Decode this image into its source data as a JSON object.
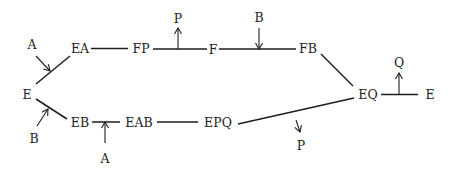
{
  "diagram": {
    "type": "enzyme-mechanism",
    "colors": {
      "ink": "#1e1e1e",
      "background": "#ffffff"
    },
    "nodes": [
      {
        "id": "E_left",
        "label": "E"
      },
      {
        "id": "EA",
        "label": "EA"
      },
      {
        "id": "FP",
        "label": "FP"
      },
      {
        "id": "F",
        "label": "F"
      },
      {
        "id": "FB",
        "label": "FB"
      },
      {
        "id": "EQ",
        "label": "EQ"
      },
      {
        "id": "E_right",
        "label": "E"
      },
      {
        "id": "EB",
        "label": "EB"
      },
      {
        "id": "EAB",
        "label": "EAB"
      },
      {
        "id": "EPQ",
        "label": "EPQ"
      }
    ],
    "edges": [
      {
        "from": "E_left",
        "to": "EA"
      },
      {
        "from": "EA",
        "to": "FP"
      },
      {
        "from": "FP",
        "to": "F"
      },
      {
        "from": "F",
        "to": "FB"
      },
      {
        "from": "FB",
        "to": "EQ"
      },
      {
        "from": "EQ",
        "to": "E_right"
      },
      {
        "from": "E_left",
        "to": "EB"
      },
      {
        "from": "EB",
        "to": "EAB"
      },
      {
        "from": "EAB",
        "to": "EPQ"
      },
      {
        "from": "EPQ",
        "to": "EQ"
      }
    ],
    "substrates_products": [
      {
        "id": "A_in_top",
        "label": "A",
        "direction": "in",
        "on_edge": "E_left-EA"
      },
      {
        "id": "P_out_top",
        "label": "P",
        "direction": "out",
        "on_edge": "FP-F"
      },
      {
        "id": "B_in_top",
        "label": "B",
        "direction": "in",
        "on_edge": "F-FB"
      },
      {
        "id": "Q_out_right",
        "label": "Q",
        "direction": "out",
        "on_edge": "EQ-E_right"
      },
      {
        "id": "B_in_bottom",
        "label": "B",
        "direction": "in",
        "on_edge": "E_left-EB"
      },
      {
        "id": "A_in_bottom",
        "label": "A",
        "direction": "in",
        "on_edge": "EB-EAB"
      },
      {
        "id": "P_out_bottom",
        "label": "P",
        "direction": "out",
        "on_edge": "EPQ-EQ"
      }
    ]
  }
}
